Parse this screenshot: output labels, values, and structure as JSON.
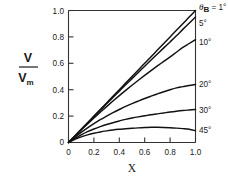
{
  "chart_data": {
    "type": "line",
    "title": "",
    "xlabel": "X",
    "ylabel": "V/Vm",
    "ylabel_numerator": "V",
    "ylabel_denominator": "V",
    "ylabel_denominator_sub": "m",
    "xlim": [
      0.0,
      1.0
    ],
    "ylim": [
      0.0,
      1.0
    ],
    "grid": false,
    "legend_position": "right-outside",
    "xticks": [
      0,
      0.2,
      0.4,
      0.6,
      0.8,
      1.0
    ],
    "xticklabels": [
      "0",
      "0.2",
      "0.4",
      "0.6",
      "0.8",
      "1.0"
    ],
    "yticks": [
      0,
      0.2,
      0.4,
      0.6,
      0.8,
      1.0
    ],
    "yticklabels": [
      "0",
      "0.2",
      "0.4",
      "0.6",
      "0.8",
      "1.0"
    ],
    "legend_header": "θ",
    "legend_header_sub": "B",
    "legend_header_eq": " = 1°",
    "x": [
      0.0,
      0.05,
      0.1,
      0.15,
      0.2,
      0.25,
      0.3,
      0.35,
      0.4,
      0.45,
      0.5,
      0.55,
      0.6,
      0.65,
      0.7,
      0.75,
      0.8,
      0.85,
      0.9,
      0.95,
      1.0
    ],
    "series": [
      {
        "name": "1°",
        "label": "θ_B = 1°",
        "endpoint": 1.0,
        "values": [
          0.0,
          0.05,
          0.1,
          0.15,
          0.2,
          0.25,
          0.3,
          0.35,
          0.4,
          0.45,
          0.5,
          0.55,
          0.6,
          0.65,
          0.7,
          0.75,
          0.8,
          0.85,
          0.9,
          0.95,
          1.0
        ]
      },
      {
        "name": "5°",
        "label": "5°",
        "endpoint": 0.95,
        "values": [
          0.0,
          0.049,
          0.098,
          0.147,
          0.196,
          0.245,
          0.293,
          0.341,
          0.389,
          0.437,
          0.484,
          0.531,
          0.578,
          0.625,
          0.671,
          0.717,
          0.762,
          0.808,
          0.857,
          0.904,
          0.95
        ]
      },
      {
        "name": "10°",
        "label": "10°",
        "endpoint": 0.78,
        "values": [
          0.0,
          0.047,
          0.094,
          0.14,
          0.185,
          0.229,
          0.272,
          0.314,
          0.355,
          0.395,
          0.434,
          0.472,
          0.509,
          0.545,
          0.58,
          0.614,
          0.648,
          0.684,
          0.72,
          0.75,
          0.78
        ]
      },
      {
        "name": "20°",
        "label": "20°",
        "endpoint": 0.44,
        "values": [
          0.0,
          0.04,
          0.077,
          0.111,
          0.143,
          0.173,
          0.2,
          0.226,
          0.25,
          0.273,
          0.294,
          0.314,
          0.333,
          0.351,
          0.368,
          0.384,
          0.4,
          0.414,
          0.423,
          0.432,
          0.44
        ]
      },
      {
        "name": "30°",
        "label": "30°",
        "endpoint": 0.25,
        "values": [
          0.0,
          0.031,
          0.058,
          0.082,
          0.102,
          0.12,
          0.136,
          0.15,
          0.163,
          0.175,
          0.185,
          0.194,
          0.202,
          0.21,
          0.217,
          0.224,
          0.231,
          0.237,
          0.242,
          0.246,
          0.25
        ]
      },
      {
        "name": "45°",
        "label": "45°",
        "endpoint": 0.09,
        "values": [
          0.0,
          0.024,
          0.043,
          0.058,
          0.07,
          0.08,
          0.088,
          0.095,
          0.1,
          0.104,
          0.108,
          0.111,
          0.113,
          0.115,
          0.115,
          0.114,
          0.112,
          0.109,
          0.105,
          0.1,
          0.09
        ]
      }
    ]
  }
}
